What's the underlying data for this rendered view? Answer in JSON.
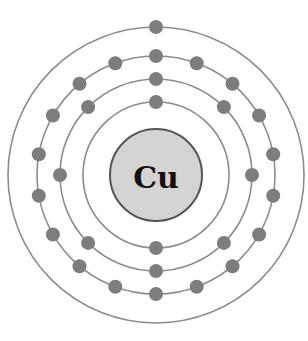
{
  "diagram": {
    "type": "bohr-model",
    "element_symbol": "Cu",
    "element_name": "Copper",
    "atomic_number": 29,
    "center": [
      156,
      175
    ],
    "nucleus": {
      "radius": 46,
      "fill": "#d4d4d4",
      "stroke": "#555555"
    },
    "colors": {
      "ring": "#8c8c8c",
      "electron": "#7d7d7d",
      "background": "#ffffff",
      "text": "#111111"
    },
    "shells": [
      {
        "n": 1,
        "radius": 73,
        "electrons": 2
      },
      {
        "n": 2,
        "radius": 96,
        "electrons": 8
      },
      {
        "n": 3,
        "radius": 119,
        "electrons": 18
      },
      {
        "n": 4,
        "radius": 148,
        "electrons": 1
      }
    ],
    "electron_configuration": [
      2,
      8,
      18,
      1
    ]
  }
}
